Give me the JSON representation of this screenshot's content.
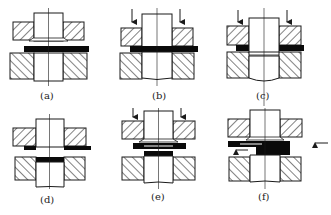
{
  "figure": {
    "colors": {
      "line": "#1a1a1a",
      "strip": "#0a0a0a",
      "background": "#ffffff"
    },
    "panels": [
      {
        "id": "a",
        "label": "(a)",
        "arrows_down": false,
        "arrows_side": false
      },
      {
        "id": "b",
        "label": "(b)",
        "arrows_down": true,
        "arrows_side": false
      },
      {
        "id": "c",
        "label": "(c)",
        "arrows_down": true,
        "arrows_side": false
      },
      {
        "id": "d",
        "label": "(d)",
        "arrows_down": false,
        "arrows_side": false
      },
      {
        "id": "e",
        "label": "(e)",
        "arrows_down": true,
        "arrows_side": false
      },
      {
        "id": "f",
        "label": "(f)",
        "arrows_down": false,
        "arrows_side": true
      }
    ]
  }
}
